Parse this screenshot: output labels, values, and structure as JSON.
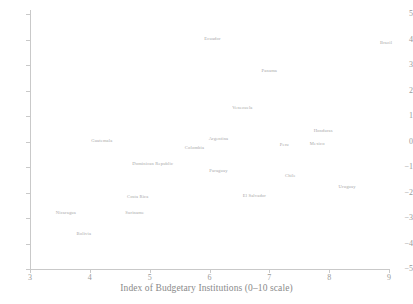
{
  "chart_data": {
    "type": "scatter",
    "title": "",
    "xlabel": "Index of Budgetary Institutions (0–10 scale)",
    "ylabel": "",
    "xlim": [
      3,
      9
    ],
    "ylim": [
      -5,
      5
    ],
    "xticks": [
      "3",
      "4",
      "5",
      "6",
      "7",
      "8",
      "9"
    ],
    "yticks": [
      "5",
      "4",
      "3",
      "2",
      "1",
      "0",
      "−1",
      "−2",
      "−3",
      "−4",
      "−5"
    ],
    "grid": false,
    "legend": "none",
    "marker_style": "text-label-only",
    "label_color": "#a8a8a8",
    "points": [
      {
        "label": "Ecuador",
        "x": 6.05,
        "y": 4.05
      },
      {
        "label": "Brazil",
        "x": 8.95,
        "y": 3.9
      },
      {
        "label": "Panama",
        "x": 7.0,
        "y": 2.8
      },
      {
        "label": "Venezuela",
        "x": 6.55,
        "y": 1.35
      },
      {
        "label": "Honduras",
        "x": 7.9,
        "y": 0.45
      },
      {
        "label": "Argentina",
        "x": 6.15,
        "y": 0.15
      },
      {
        "label": "Guatemala",
        "x": 4.2,
        "y": 0.05
      },
      {
        "label": "Mexico",
        "x": 7.8,
        "y": -0.05
      },
      {
        "label": "Peru",
        "x": 7.25,
        "y": -0.1
      },
      {
        "label": "Colombia",
        "x": 5.75,
        "y": -0.2
      },
      {
        "label": "Dominican Republic",
        "x": 5.05,
        "y": -0.85
      },
      {
        "label": "Paraguay",
        "x": 6.15,
        "y": -1.1
      },
      {
        "label": "Chile",
        "x": 7.35,
        "y": -1.3
      },
      {
        "label": "Uruguay",
        "x": 8.3,
        "y": -1.75
      },
      {
        "label": "El Salvador",
        "x": 6.75,
        "y": -2.1
      },
      {
        "label": "Costa Rica",
        "x": 4.8,
        "y": -2.15
      },
      {
        "label": "Nicaragua",
        "x": 3.6,
        "y": -2.75
      },
      {
        "label": "Suriname",
        "x": 4.75,
        "y": -2.75
      },
      {
        "label": "Bolivia",
        "x": 3.9,
        "y": -3.6
      }
    ]
  }
}
